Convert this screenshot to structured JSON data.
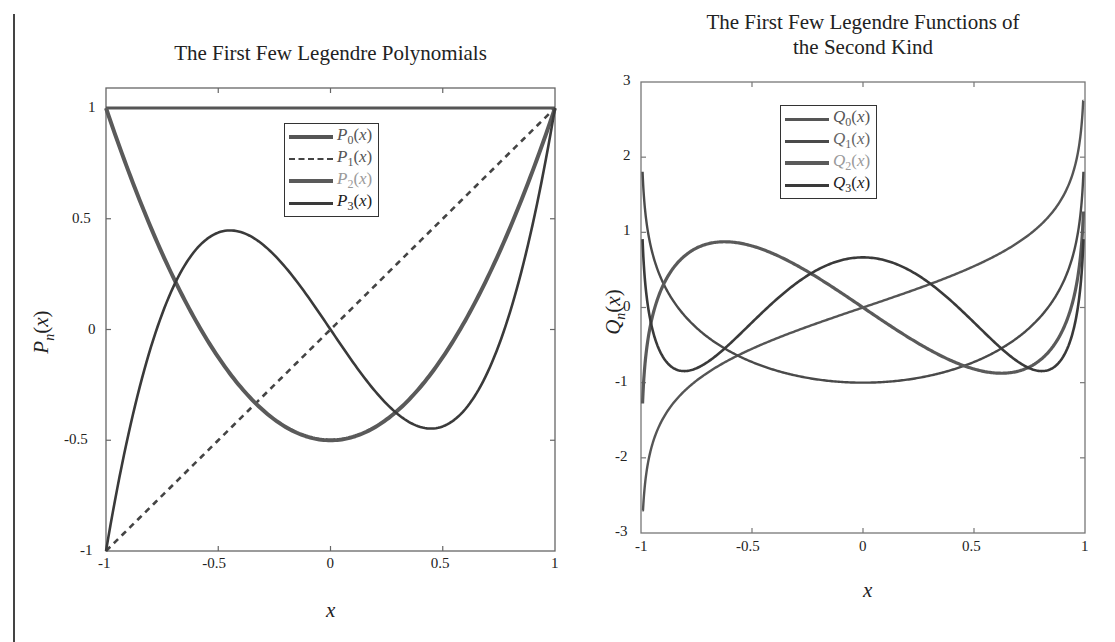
{
  "page": {
    "left_title": "The First Few Legendre Polynomials",
    "right_title_line1": "The First Few Legendre Functions of",
    "right_title_line2": "the Second Kind"
  },
  "chart_data": [
    {
      "type": "line",
      "title": "The First Few Legendre Polynomials",
      "xlabel": "x",
      "ylabel": "P_n(x)",
      "xlim": [
        -1,
        1
      ],
      "ylim": [
        -1,
        1.09
      ],
      "xticks": [
        "-1",
        "-0.5",
        "0",
        "0.5",
        "1"
      ],
      "yticks": [
        "-1",
        "-0.5",
        "0",
        "0.5",
        "1"
      ],
      "grid": false,
      "legend_position": "upper center-right",
      "series": [
        {
          "name": "P0(x)",
          "label_base": "P",
          "label_sub": "0",
          "style": "solid",
          "width": 3.2,
          "color": "#555555",
          "label_color": "#555555",
          "formula": "1"
        },
        {
          "name": "P1(x)",
          "label_base": "P",
          "label_sub": "1",
          "style": "dashed",
          "width": 2.6,
          "color": "#444444",
          "label_color": "#555555",
          "formula": "x"
        },
        {
          "name": "P2(x)",
          "label_base": "P",
          "label_sub": "2",
          "style": "solid",
          "width": 4.0,
          "color": "#5a5a5a",
          "label_color": "#9a9a9a",
          "formula": "(3x^2-1)/2"
        },
        {
          "name": "P3(x)",
          "label_base": "P",
          "label_sub": "3",
          "style": "solid",
          "width": 2.6,
          "color": "#3a3a3a",
          "label_color": "#222222",
          "formula": "(5x^3-3x)/2"
        }
      ],
      "key_points": {
        "P2_min": [
          0,
          -0.5
        ],
        "P3_max": [
          -0.447,
          0.447
        ],
        "P3_min": [
          0.447,
          -0.447
        ],
        "all_meet": [
          1,
          1
        ]
      }
    },
    {
      "type": "line",
      "title": "The First Few Legendre Functions of the Second Kind",
      "xlabel": "x",
      "ylabel": "Q_n(x)",
      "xlim": [
        -1,
        1
      ],
      "ylim": [
        -3,
        3
      ],
      "xticks": [
        "-1",
        "-0.5",
        "0",
        "0.5",
        "1"
      ],
      "yticks": [
        "-3",
        "-2",
        "-1",
        "0",
        "1",
        "2",
        "3"
      ],
      "grid": false,
      "legend_position": "upper center",
      "series": [
        {
          "name": "Q0(x)",
          "label_base": "Q",
          "label_sub": "0",
          "style": "solid",
          "width": 2.4,
          "color": "#555555",
          "label_color": "#555555",
          "formula": "0.5*ln((1+x)/(1-x))"
        },
        {
          "name": "Q1(x)",
          "label_base": "Q",
          "label_sub": "1",
          "style": "solid",
          "width": 2.4,
          "color": "#4a4a4a",
          "label_color": "#666666",
          "formula": "x*Q0-1"
        },
        {
          "name": "Q2(x)",
          "label_base": "Q",
          "label_sub": "2",
          "style": "solid",
          "width": 3.2,
          "color": "#5a5a5a",
          "label_color": "#9a9a9a",
          "formula": "P2*Q0-1.5x"
        },
        {
          "name": "Q3(x)",
          "label_base": "Q",
          "label_sub": "3",
          "style": "solid",
          "width": 2.6,
          "color": "#3a3a3a",
          "label_color": "#222222",
          "formula": "P3*Q0-2.5x^2+2/3"
        }
      ],
      "key_points": {
        "Q0_range": [
          -2.65,
          2.65
        ],
        "Q1_min": [
          0,
          -1
        ],
        "Q2_max": [
          -0.65,
          0.87
        ],
        "Q3_max": [
          0,
          0.67
        ]
      }
    }
  ],
  "axes": {
    "left": {
      "x0_px": 106,
      "x1_px": 555,
      "yTop_px": 88,
      "y_at_1": 108,
      "y_at_m1": 551
    },
    "right": {
      "x0_px": 641,
      "x1_px": 1085,
      "yTop_px": 82,
      "y_at_3": 82,
      "y_at_m3": 533
    }
  }
}
